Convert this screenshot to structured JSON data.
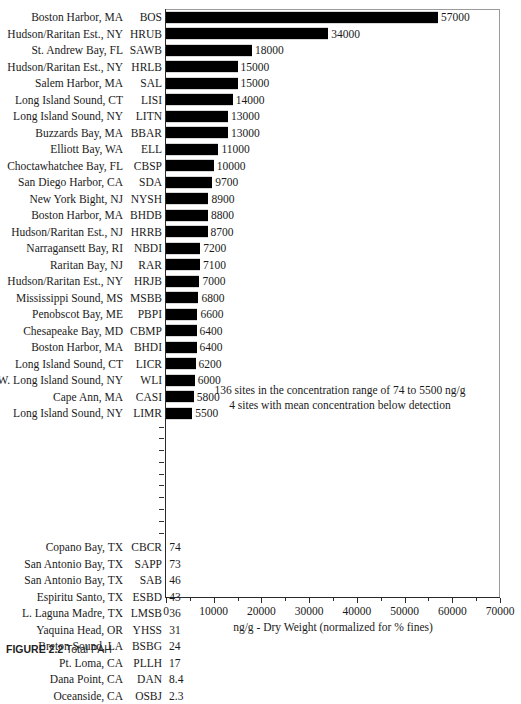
{
  "chart_data": {
    "type": "bar",
    "orientation": "horizontal",
    "title": "",
    "xlabel": "ng/g - Dry Weight (normalized for % fines)",
    "ylabel": "",
    "xlim": [
      0,
      70000
    ],
    "xticks": [
      0,
      10000,
      20000,
      30000,
      40000,
      50000,
      60000,
      70000
    ],
    "xticklabels": [
      "0",
      "10000",
      "20000",
      "30000",
      "40000",
      "50000",
      "60000",
      "70000"
    ],
    "grid": false,
    "legend": null,
    "bar_color": "#000000",
    "categories": [
      "BOS",
      "HRUB",
      "SAWB",
      "HRLB",
      "SAL",
      "LISI",
      "LITN",
      "BBAR",
      "ELL",
      "CBSP",
      "SDA",
      "NYSH",
      "BHDB",
      "HRRB",
      "NBDI",
      "RAR",
      "HRJB",
      "MSBB",
      "PBPI",
      "CBMP",
      "BHDI",
      "LICR",
      "WLI",
      "CASI",
      "LIMR",
      "CBCR",
      "SAPP",
      "SAB",
      "ESBD",
      "LMSB",
      "YHSS",
      "BSBG",
      "PLLH",
      "DAN",
      "OSBJ"
    ],
    "values": [
      57000,
      34000,
      18000,
      15000,
      15000,
      14000,
      13000,
      13000,
      11000,
      10000,
      9700,
      8900,
      8800,
      8700,
      7200,
      7100,
      7000,
      6800,
      6600,
      6400,
      6400,
      6200,
      6000,
      5800,
      5500,
      74,
      73,
      46,
      43,
      36,
      31,
      24,
      17,
      8.4,
      2.3
    ],
    "annotations": [
      "136 sites in the concentration range of 74 to 5500 ng/g",
      "4 sites with mean concentration below detection"
    ]
  },
  "rows_top": [
    {
      "site": "Boston Harbor, MA",
      "code": "BOS",
      "value": 57000,
      "label": "57000"
    },
    {
      "site": "Hudson/Raritan Est., NY",
      "code": "HRUB",
      "value": 34000,
      "label": "34000"
    },
    {
      "site": "St. Andrew Bay, FL",
      "code": "SAWB",
      "value": 18000,
      "label": "18000"
    },
    {
      "site": "Hudson/Raritan Est., NY",
      "code": "HRLB",
      "value": 15000,
      "label": "15000"
    },
    {
      "site": "Salem Harbor, MA",
      "code": "SAL",
      "value": 15000,
      "label": "15000"
    },
    {
      "site": "Long Island Sound, CT",
      "code": "LISI",
      "value": 14000,
      "label": "14000"
    },
    {
      "site": "Long Island Sound, NY",
      "code": "LITN",
      "value": 13000,
      "label": "13000"
    },
    {
      "site": "Buzzards Bay, MA",
      "code": "BBAR",
      "value": 13000,
      "label": "13000"
    },
    {
      "site": "Elliott Bay, WA",
      "code": "ELL",
      "value": 11000,
      "label": "11000"
    },
    {
      "site": "Choctawhatchee Bay, FL",
      "code": "CBSP",
      "value": 10000,
      "label": "10000"
    },
    {
      "site": "San Diego Harbor, CA",
      "code": "SDA",
      "value": 9700,
      "label": "9700"
    },
    {
      "site": "New York Bight, NJ",
      "code": "NYSH",
      "value": 8900,
      "label": "8900"
    },
    {
      "site": "Boston Harbor, MA",
      "code": "BHDB",
      "value": 8800,
      "label": "8800"
    },
    {
      "site": "Hudson/Raritan Est., NJ",
      "code": "HRRB",
      "value": 8700,
      "label": "8700"
    },
    {
      "site": "Narragansett Bay, RI",
      "code": "NBDI",
      "value": 7200,
      "label": "7200"
    },
    {
      "site": "Raritan Bay, NJ",
      "code": "RAR",
      "value": 7100,
      "label": "7100"
    },
    {
      "site": "Hudson/Raritan Est., NY",
      "code": "HRJB",
      "value": 7000,
      "label": "7000"
    },
    {
      "site": "Mississippi Sound, MS",
      "code": "MSBB",
      "value": 6800,
      "label": "6800"
    },
    {
      "site": "Penobscot Bay, ME",
      "code": "PBPI",
      "value": 6600,
      "label": "6600"
    },
    {
      "site": "Chesapeake Bay, MD",
      "code": "CBMP",
      "value": 6400,
      "label": "6400"
    },
    {
      "site": "Boston Harbor, MA",
      "code": "BHDI",
      "value": 6400,
      "label": "6400"
    },
    {
      "site": "Long Island Sound, CT",
      "code": "LICR",
      "value": 6200,
      "label": "6200"
    },
    {
      "site": "W. Long Island Sound, NY",
      "code": "WLI",
      "value": 6000,
      "label": "6000"
    },
    {
      "site": "Cape Ann, MA",
      "code": "CASI",
      "value": 5800,
      "label": "5800"
    },
    {
      "site": "Long Island Sound, NY",
      "code": "LIMR",
      "value": 5500,
      "label": "5500"
    }
  ],
  "gap_dash_count": 10,
  "rows_bottom": [
    {
      "site": "Copano Bay, TX",
      "code": "CBCR",
      "value": 74,
      "label": "74"
    },
    {
      "site": "San Antonio Bay, TX",
      "code": "SAPP",
      "value": 73,
      "label": "73"
    },
    {
      "site": "San Antonio Bay, TX",
      "code": "SAB",
      "value": 46,
      "label": "46"
    },
    {
      "site": "Espiritu Santo, TX",
      "code": "ESBD",
      "value": 43,
      "label": "43"
    },
    {
      "site": "L. Laguna Madre, TX",
      "code": "LMSB",
      "value": 36,
      "label": "36"
    },
    {
      "site": "Yaquina Head, OR",
      "code": "YHSS",
      "value": 31,
      "label": "31"
    },
    {
      "site": "Breton Sound, LA",
      "code": "BSBG",
      "value": 24,
      "label": "24"
    },
    {
      "site": "Pt. Loma, CA",
      "code": "PLLH",
      "value": 17,
      "label": "17"
    },
    {
      "site": "Dana Point, CA",
      "code": "DAN",
      "value": 8.4,
      "label": "8.4"
    },
    {
      "site": "Oceanside, CA",
      "code": "OSBJ",
      "value": 2.3,
      "label": "2.3"
    }
  ],
  "annotation": {
    "line1": "136 sites in the concentration range of 74 to 5500 ng/g",
    "line2": "4 sites with mean concentration below detection"
  },
  "axis": {
    "x_title": "ng/g - Dry Weight (normalized for % fines)",
    "ticks": [
      "0",
      "10000",
      "20000",
      "30000",
      "40000",
      "50000",
      "60000",
      "70000"
    ],
    "max": 70000
  },
  "caption": {
    "label": "FIGURE 2.2",
    "text": "Total PAH"
  }
}
